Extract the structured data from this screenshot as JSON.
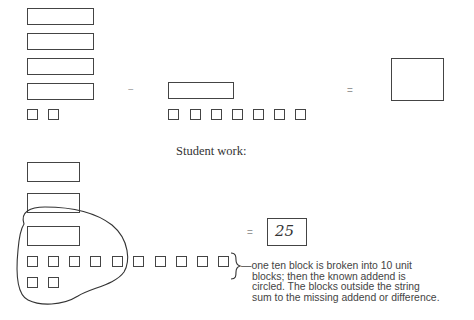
{
  "problem": {
    "minuend": {
      "tens": 4,
      "units": 2
    },
    "operator": "−",
    "subtrahend": {
      "tens": 1,
      "units": 7
    },
    "equals": "=",
    "answer": ""
  },
  "student_work": {
    "heading": "Student work:",
    "tens_remaining": 3,
    "units_after_regroup": 12,
    "equals": "=",
    "answer": "25",
    "note_lines": [
      "—one ten block is broken into 10 unit",
      "blocks; then the known addend is",
      "circled. The blocks outside the string",
      "sum to the missing addend or difference."
    ]
  }
}
